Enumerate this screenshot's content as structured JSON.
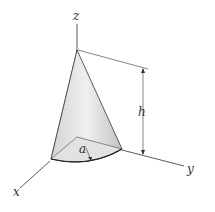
{
  "diagram": {
    "type": "cone-octant",
    "axes": {
      "z_label": "z",
      "y_label": "y",
      "x_label": "x"
    },
    "dimensions": {
      "height_label": "h",
      "radius_label": "a"
    },
    "colors": {
      "line": "#333333",
      "fill_light": "#e8e8e8",
      "fill_dark": "#c8c8c8",
      "background": "#ffffff"
    }
  }
}
